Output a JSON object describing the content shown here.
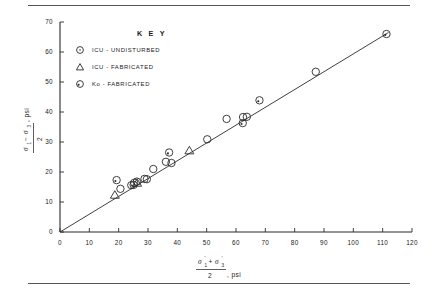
{
  "figure": {
    "has_top_rule": true,
    "has_bottom_rule": true,
    "background_color": "#ffffff",
    "ink_color": "#2a2a2a"
  },
  "legend": {
    "title": "K E Y",
    "position": "upper-left-inside",
    "entries": [
      {
        "marker": "circle-open",
        "label": "ICU  -  UNDISTURBED"
      },
      {
        "marker": "triangle-open",
        "label": "ICU  -  FABRICATED"
      },
      {
        "marker": "circle-dot",
        "label": "Ko  -  FABRICATED"
      }
    ]
  },
  "axis_titles": {
    "x_numerator_left": "σ",
    "x_numerator_left_prime": "'",
    "x_numerator_left_sub": "1",
    "x_numerator_plus": "+",
    "x_numerator_right": "σ",
    "x_numerator_right_prime": "'",
    "x_numerator_right_sub": "3",
    "x_denominator": "2",
    "x_units": ", psi",
    "y_numerator_left": "σ",
    "y_numerator_left_sub": "1",
    "y_numerator_minus": "−",
    "y_numerator_right": "σ",
    "y_numerator_right_sub": "3",
    "y_denominator": "2",
    "y_units": ", psi"
  },
  "chart_data": {
    "type": "scatter",
    "title": "",
    "xlabel": "(σ'1 + σ'3)/2, psi",
    "ylabel": "(σ1 − σ3)/2, psi",
    "xlim": [
      0,
      120
    ],
    "ylim": [
      0,
      70
    ],
    "xticks": [
      0,
      10,
      20,
      30,
      40,
      50,
      60,
      70,
      80,
      90,
      100,
      110,
      120
    ],
    "yticks": [
      0,
      10,
      20,
      30,
      40,
      50,
      60,
      70
    ],
    "xtick_labels": [
      "0",
      "10",
      "20",
      "30",
      "40",
      "50",
      "60",
      "70",
      "80",
      "90",
      "100",
      "110",
      "120"
    ],
    "ytick_labels": [
      "0",
      "10",
      "20",
      "30",
      "40",
      "50",
      "60",
      "70"
    ],
    "grid": false,
    "legend_position": "upper-left",
    "fit_line": {
      "label": "failure envelope",
      "x0": 0,
      "y0": 0,
      "x1": 112,
      "y1": 66.5,
      "slope": 0.594,
      "intercept": 0
    },
    "series": [
      {
        "name": "ICU  -  UNDISTURBED",
        "marker": "circle-open",
        "points": [
          [
            20.6,
            14.4
          ],
          [
            24.3,
            15.6
          ],
          [
            25.3,
            16.4
          ],
          [
            26.2,
            16.8
          ],
          [
            28.8,
            17.7
          ],
          [
            29.6,
            17.6
          ],
          [
            31.8,
            21.0
          ],
          [
            36.1,
            23.4
          ],
          [
            38.0,
            23.0
          ],
          [
            50.2,
            30.9
          ],
          [
            56.8,
            37.7
          ],
          [
            62.4,
            38.3
          ],
          [
            63.7,
            38.4
          ],
          [
            87.2,
            53.4
          ]
        ]
      },
      {
        "name": "ICU  -  FABRICATED",
        "marker": "triangle-open",
        "points": [
          [
            18.7,
            12.3
          ],
          [
            26.3,
            16.3
          ],
          [
            44.1,
            27.1
          ]
        ]
      },
      {
        "name": "Ko  -  FABRICATED",
        "marker": "circle-dot",
        "points": [
          [
            19.3,
            17.3
          ],
          [
            25.1,
            15.7
          ],
          [
            37.2,
            26.5
          ],
          [
            62.3,
            36.3
          ],
          [
            68.0,
            43.9
          ],
          [
            111.3,
            66.0
          ]
        ]
      }
    ]
  }
}
